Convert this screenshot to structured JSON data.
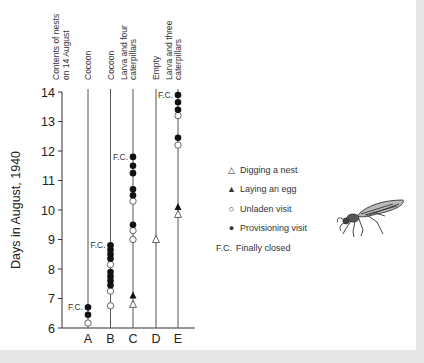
{
  "chart_data": {
    "type": "scatter",
    "title": "",
    "xlabel": "Contents of nests on 14 August",
    "ylabel": "Days in August, 1940",
    "ylim": [
      6,
      14
    ],
    "yticks": [
      6,
      7,
      8,
      9,
      10,
      11,
      12,
      13,
      14
    ],
    "categories": [
      "A",
      "B",
      "C",
      "D",
      "E"
    ],
    "column_headers": [
      "Cocoon",
      "Cocoon",
      "Larva and four caterpillars",
      "Empty",
      "Larva and three caterpillars"
    ],
    "header_title": "Contents of nests on 14 August",
    "fc_label": "F.C.",
    "series": [
      {
        "name": "Digging a nest",
        "marker": "open-triangle",
        "points": [
          {
            "nest": "C",
            "day": 6.8
          },
          {
            "nest": "D",
            "day": 9.0
          },
          {
            "nest": "E",
            "day": 9.85
          }
        ]
      },
      {
        "name": "Laying an egg",
        "marker": "filled-triangle",
        "points": [
          {
            "nest": "C",
            "day": 7.1
          },
          {
            "nest": "E",
            "day": 10.1
          }
        ]
      },
      {
        "name": "Unladen visit",
        "marker": "open-circle",
        "points": [
          {
            "nest": "A",
            "day": 6.17
          },
          {
            "nest": "B",
            "day": 6.75
          },
          {
            "nest": "B",
            "day": 7.25
          },
          {
            "nest": "B",
            "day": 8.15
          },
          {
            "nest": "C",
            "day": 9.0
          },
          {
            "nest": "C",
            "day": 9.3
          },
          {
            "nest": "C",
            "day": 10.3
          },
          {
            "nest": "E",
            "day": 12.2
          },
          {
            "nest": "E",
            "day": 13.2
          }
        ]
      },
      {
        "name": "Provisioning visit",
        "marker": "filled-circle",
        "points": [
          {
            "nest": "A",
            "day": 6.45
          },
          {
            "nest": "A",
            "day": 6.7
          },
          {
            "nest": "B",
            "day": 7.45
          },
          {
            "nest": "B",
            "day": 7.6
          },
          {
            "nest": "B",
            "day": 7.75
          },
          {
            "nest": "B",
            "day": 7.9
          },
          {
            "nest": "B",
            "day": 8.35
          },
          {
            "nest": "B",
            "day": 8.5
          },
          {
            "nest": "B",
            "day": 8.65
          },
          {
            "nest": "B",
            "day": 8.8
          },
          {
            "nest": "C",
            "day": 9.5
          },
          {
            "nest": "C",
            "day": 10.5
          },
          {
            "nest": "C",
            "day": 10.7
          },
          {
            "nest": "C",
            "day": 11.25
          },
          {
            "nest": "C",
            "day": 11.5
          },
          {
            "nest": "C",
            "day": 11.8
          },
          {
            "nest": "E",
            "day": 12.45
          },
          {
            "nest": "E",
            "day": 13.4
          },
          {
            "nest": "E",
            "day": 13.65
          },
          {
            "nest": "E",
            "day": 13.9
          }
        ]
      }
    ],
    "finally_closed": [
      {
        "nest": "A",
        "day": 6.7
      },
      {
        "nest": "B",
        "day": 8.8
      },
      {
        "nest": "C",
        "day": 11.8
      },
      {
        "nest": "E",
        "day": 13.9
      }
    ],
    "legend": [
      {
        "symbol": "△",
        "label": "Digging a nest"
      },
      {
        "symbol": "▲",
        "label": "Laying an egg"
      },
      {
        "symbol": "○",
        "label": "Unladen visit"
      },
      {
        "symbol": "●",
        "label": "Provisioning visit"
      },
      {
        "symbol": "F.C.",
        "label": "Finally closed"
      }
    ],
    "legend_position": "right",
    "grid": false
  },
  "illustration": "wasp-illustration"
}
